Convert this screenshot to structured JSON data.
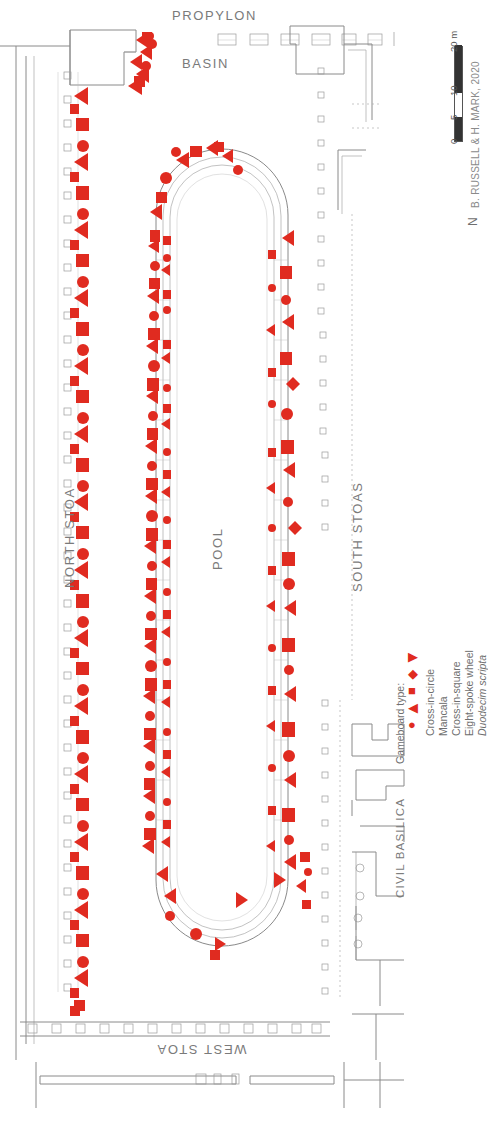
{
  "plan": {
    "orientation_note": "plan rotated 90 degrees; labels read bottom-to-top",
    "labels": {
      "propylon": "PROPYLON",
      "basin": "BASIN",
      "north_stoa": "NORTH STOA",
      "pool": "POOL",
      "south_stoas": "SOUTH STOAS",
      "civil_basilica": "CIVIL BASILICA",
      "west_stoa": "WEST STOA"
    }
  },
  "legend": {
    "title": "Gameboard type:",
    "items": [
      {
        "label": "Cross-in-circle",
        "marker": "circle",
        "glyph": "●",
        "color": "#e02b20"
      },
      {
        "label": "Mancala",
        "marker": "left-triangle",
        "glyph": "◀",
        "color": "#e02b20"
      },
      {
        "label": "Cross-in-square",
        "marker": "square",
        "glyph": "■",
        "color": "#e02b20"
      },
      {
        "label": "Eight-spoke wheel",
        "marker": "diamond",
        "glyph": "◆",
        "color": "#e02b20"
      },
      {
        "label": "Duodecim scripta",
        "marker": "right-triangle",
        "glyph": "▶",
        "color": "#e02b20",
        "italic": true
      }
    ]
  },
  "scale": {
    "ticks": [
      "0",
      "5",
      "10",
      "20"
    ],
    "unit": "m",
    "unit_label": "20 m"
  },
  "credit": {
    "text": "B. RUSSELL & H. MARK, 2020"
  },
  "north": {
    "label": "N"
  },
  "colors": {
    "marker_red": "#e02b20",
    "line_grey": "#8a8a8a",
    "text_grey": "#6f6f6f",
    "background": "#ffffff"
  }
}
